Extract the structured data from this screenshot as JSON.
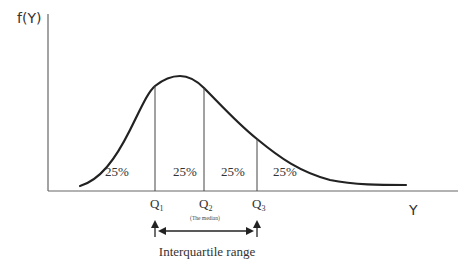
{
  "diagram": {
    "type": "density-curve-quartiles",
    "y_axis_label": "f(Y)",
    "x_axis_label": "Y",
    "quartiles": [
      {
        "label": "Q",
        "sub": "1",
        "note": ""
      },
      {
        "label": "Q",
        "sub": "2",
        "note": "(The median)"
      },
      {
        "label": "Q",
        "sub": "3",
        "note": ""
      }
    ],
    "regions": [
      {
        "label": "25%"
      },
      {
        "label": "25%"
      },
      {
        "label": "25%"
      },
      {
        "label": "25%"
      }
    ],
    "range_label": "Interquartile range",
    "colors": {
      "curve": "#222222",
      "axis": "#666666",
      "text": "#333333"
    }
  }
}
